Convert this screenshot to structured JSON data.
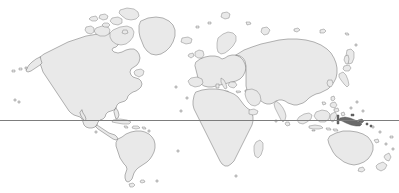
{
  "map": {
    "title": "World Map",
    "projection": "equirectangular",
    "width": 399,
    "height": 193,
    "background_color": "#ffffff",
    "land_fill_color": "#e9e9e9",
    "land_stroke_color": "#6b6b6b",
    "highlight_fill_color": "#6a6a6a",
    "equator": {
      "label": "equator",
      "color": "#7d7d7d",
      "y": 120.5,
      "x_start": 0,
      "x_end": 399,
      "stroke_width": 1
    },
    "regions": [
      {
        "name": "north-america",
        "label": "North America"
      },
      {
        "name": "greenland",
        "label": "Greenland"
      },
      {
        "name": "canadian-arctic",
        "label": "Canadian Arctic Archipelago"
      },
      {
        "name": "south-america",
        "label": "South America"
      },
      {
        "name": "africa",
        "label": "Africa"
      },
      {
        "name": "europe",
        "label": "Europe"
      },
      {
        "name": "asia",
        "label": "Asia"
      },
      {
        "name": "india",
        "label": "India"
      },
      {
        "name": "indonesia",
        "label": "Indonesia"
      },
      {
        "name": "australia",
        "label": "Australia"
      },
      {
        "name": "new-zealand",
        "label": "New Zealand"
      },
      {
        "name": "japan",
        "label": "Japan"
      },
      {
        "name": "madagascar",
        "label": "Madagascar"
      },
      {
        "name": "british-isles",
        "label": "British Isles"
      },
      {
        "name": "iceland",
        "label": "Iceland"
      },
      {
        "name": "papua-new-guinea",
        "label": "Papua New Guinea",
        "highlighted": true
      }
    ],
    "highlighted_region": {
      "name": "papua-new-guinea",
      "label": "Papua New Guinea",
      "color": "#6a6a6a"
    }
  }
}
